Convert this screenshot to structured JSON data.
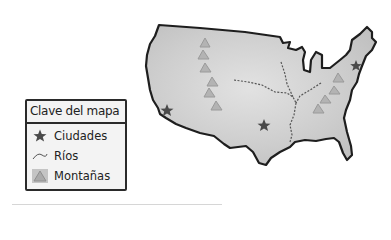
{
  "legend": {
    "title": "Clave del mapa",
    "items": [
      {
        "symbol": "star-icon",
        "label": "Ciudades"
      },
      {
        "symbol": "river-line-icon",
        "label": "Ríos"
      },
      {
        "symbol": "mountain-triangle-icon",
        "label": "Montañas"
      }
    ]
  },
  "map": {
    "subject": "United States outline",
    "colors": {
      "land": "#cfcfcf",
      "outline": "#1e1e1e",
      "star": "#4a4a4a",
      "mountain": "#a9a9a9",
      "river": "#555555"
    },
    "cities": [
      {
        "x": 167,
        "y": 110
      },
      {
        "x": 264,
        "y": 125
      },
      {
        "x": 356,
        "y": 66
      }
    ]
  }
}
